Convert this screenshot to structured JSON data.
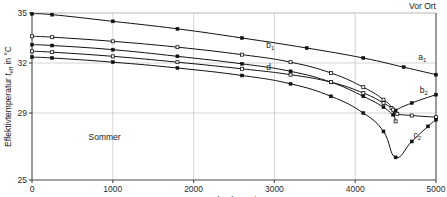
{
  "chart_data": {
    "type": "line",
    "title": "",
    "xlabel": "Streckenlänge  in m",
    "ylabel": "Effektivtemperatur",
    "ylabel_sub": "t",
    "ylabel_sub2": "eff",
    "ylabel_tail": " in °C",
    "ylabel_full": "Effektivtemperatur teff in °C",
    "xlim": [
      0,
      5000
    ],
    "ylim": [
      25,
      35
    ],
    "grid": true,
    "legend": "inline-labels",
    "xticks": [
      0,
      1000,
      2000,
      3000,
      4000,
      5000
    ],
    "xtick_labels": [
      "0",
      "1000",
      "2000",
      "3000",
      "4000",
      "5000"
    ],
    "yticks": [
      25,
      29,
      32,
      35
    ],
    "ytick_labels": [
      "25",
      "29",
      "32",
      "35"
    ],
    "gridlines_y": [
      29,
      32,
      35
    ],
    "gridlines_x": [
      1000,
      2000,
      3000,
      4000
    ],
    "annotations": [
      {
        "text": "Vor Ort",
        "x": 5000,
        "y": 35.6,
        "name": "vor-ort-label"
      },
      {
        "text": "Sommer",
        "x": 700,
        "y": 27.4,
        "name": "sommer-label"
      }
    ],
    "series": [
      {
        "name": "a1",
        "label": "a",
        "label_sub": "1",
        "label_x": 4780,
        "label_y": 32.2,
        "marker": "filled-square",
        "x": [
          0,
          250,
          1000,
          1800,
          2600,
          3400,
          4100,
          4600,
          5000
        ],
        "y": [
          34.95,
          34.9,
          34.5,
          34.05,
          33.5,
          32.9,
          32.3,
          31.75,
          31.3
        ]
      },
      {
        "name": "b1",
        "label": "b",
        "label_sub": "1",
        "label_x": 2900,
        "label_y": 32.9,
        "marker": "open-square",
        "x": [
          0,
          250,
          1000,
          1800,
          2600,
          3200,
          3700,
          4100,
          4350,
          4450,
          4500
        ],
        "y": [
          33.6,
          33.55,
          33.3,
          32.95,
          32.5,
          32.05,
          31.4,
          30.55,
          29.8,
          29.3,
          28.5
        ]
      },
      {
        "name": "b2",
        "label": "b",
        "label_sub": "2",
        "label_x": 4800,
        "label_y": 30.2,
        "marker": "filled-square",
        "x": [
          0,
          250,
          1000,
          1800,
          2600,
          3200,
          3700,
          4100,
          4350,
          4470,
          4500,
          4700,
          5000
        ],
        "y": [
          33.1,
          33.05,
          32.8,
          32.4,
          31.95,
          31.5,
          30.85,
          30.0,
          29.35,
          28.9,
          29.15,
          29.6,
          30.1
        ]
      },
      {
        "name": "d",
        "label": "d",
        "label_sub": "",
        "label_x": 2900,
        "label_y": 31.6,
        "marker": "open-square",
        "x": [
          0,
          250,
          1000,
          1800,
          2600,
          3200,
          3700,
          4100,
          4350,
          4470,
          4520,
          4700,
          5000
        ],
        "y": [
          32.7,
          32.65,
          32.4,
          32.05,
          31.65,
          31.3,
          30.85,
          30.2,
          29.6,
          29.2,
          28.95,
          28.85,
          28.75
        ]
      },
      {
        "name": "c2",
        "label": "c",
        "label_sub": "2",
        "label_x": 4720,
        "label_y": 27.5,
        "marker": "filled-square",
        "x": [
          0,
          250,
          1000,
          1800,
          2600,
          3200,
          3700,
          4100,
          4350,
          4500,
          4700,
          4900,
          5000
        ],
        "y": [
          32.35,
          32.3,
          32.05,
          31.7,
          31.25,
          30.75,
          30.0,
          29.0,
          27.9,
          26.35,
          27.3,
          28.2,
          28.6
        ]
      }
    ]
  }
}
